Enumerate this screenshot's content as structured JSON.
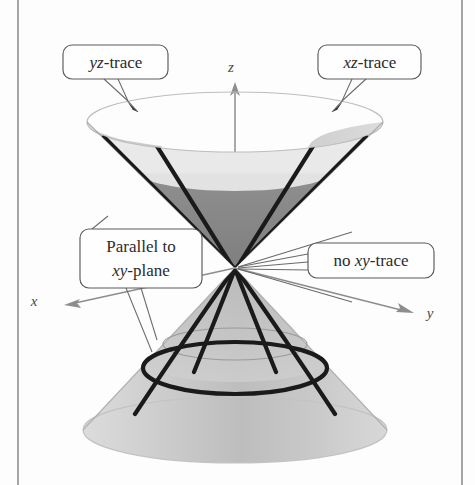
{
  "figure": {
    "kind": "3d-math-diagram",
    "background_color": "#fdfdfd"
  },
  "axes": {
    "z": {
      "label": "z",
      "direction": "up",
      "label_x": 231,
      "label_y": 72
    },
    "x": {
      "label": "x",
      "direction": "left-down",
      "label_x": 34,
      "label_y": 306
    },
    "y": {
      "label": "y",
      "direction": "right-down",
      "label_x": 430,
      "label_y": 318
    }
  },
  "callouts": [
    {
      "name": "yz-trace",
      "italic_prefix": "yz",
      "rest": "-trace",
      "box_x": 63,
      "box_y": 45,
      "box_w": 105,
      "box_h": 34,
      "text_x": 116,
      "text_y": 68
    },
    {
      "name": "xz-trace",
      "italic_prefix": "xz",
      "rest": "-trace",
      "box_x": 318,
      "box_y": 45,
      "box_w": 103,
      "box_h": 34,
      "text_x": 370,
      "text_y": 68
    },
    {
      "name": "parallel-to-xy-plane",
      "line1": "Parallel to",
      "line2_italic": "xy",
      "line2_rest": "-plane",
      "box_x": 80,
      "box_y": 229,
      "box_w": 122,
      "box_h": 59,
      "text_x": 141,
      "text_y": 252
    },
    {
      "name": "no-xy-trace",
      "prefix": "no ",
      "italic": "xy",
      "rest": "-trace",
      "box_x": 308,
      "box_y": 243,
      "box_w": 126,
      "box_h": 35,
      "text_x": 371,
      "text_y": 266
    }
  ],
  "colors": {
    "cone_light": "#e6e6e6",
    "cone_mid": "#cfcfcf",
    "cone_dark": "#8c8c8c",
    "cone_shadow": "#b5b5b5",
    "trace_stroke": "#1a1a1a",
    "leader_stroke": "#6a6a6a",
    "box_stroke": "#5a5a5a",
    "axis_stroke": "#8d8d8d",
    "page_rule": "#8e8e8e"
  },
  "geometry": {
    "apex_x": 235,
    "apex_y": 268,
    "upper_rim_cy": 122,
    "upper_rim_rx": 148,
    "upper_rim_ry": 30,
    "lower_rim_cy": 430,
    "lower_rim_rx": 152,
    "lower_rim_ry": 33,
    "circle_trace_cy": 368,
    "circle_trace_rx": 92,
    "circle_trace_ry": 26
  },
  "page": {
    "left_rule_x": 18,
    "right_rule_x": 462
  }
}
